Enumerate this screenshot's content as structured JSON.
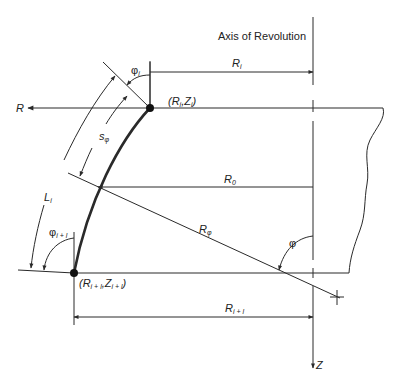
{
  "title": "Axis of Revolution",
  "labels": {
    "axis_title": "Axis of Revolution",
    "r_axis": "R",
    "z_axis": "Z",
    "R_i": {
      "main": "R",
      "sub": "i"
    },
    "R_i1": {
      "main": "R",
      "sub": "i + l"
    },
    "R_0": {
      "main": "R",
      "sub": "0"
    },
    "R_phi": {
      "main": "R",
      "sub": "φ"
    },
    "phi": "φ",
    "phi_i": {
      "main": "φ",
      "sub": "i"
    },
    "phi_i1": {
      "main": "φ",
      "sub": "i + l"
    },
    "s_phi": {
      "main": "s",
      "sub": "φ"
    },
    "L_i": {
      "main": "L",
      "sub": "i"
    },
    "point_i": {
      "open": "(R",
      "sub1": "i",
      "mid": ",Z",
      "sub2": "i",
      "close": ")"
    },
    "point_i1": {
      "open": "(R",
      "sub1": "i + l",
      "mid": ",Z",
      "sub2": "i + l",
      "close": ")"
    }
  },
  "colors": {
    "line": "#2a2a2a",
    "background": "#ffffff"
  }
}
